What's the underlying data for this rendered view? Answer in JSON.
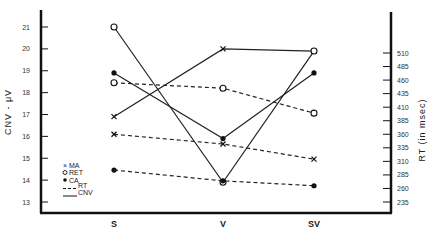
{
  "chart_data": {
    "type": "line",
    "title": "",
    "xlabel": "",
    "ylabel": "CNV - μV",
    "ylabel_right": "RT (in msec)",
    "categories": [
      "S",
      "V",
      "SV"
    ],
    "ylim": [
      13,
      21
    ],
    "ylim_right": [
      235,
      510
    ],
    "yticks": [
      "13",
      "14",
      "15",
      "16",
      "17",
      "18",
      "19",
      "20",
      "21"
    ],
    "yticks_right": [
      "235",
      "260",
      "285",
      "310",
      "335",
      "360",
      "385",
      "410",
      "435",
      "460",
      "485",
      "510"
    ],
    "grid": false,
    "legend_position": "lower-left",
    "legend": [
      {
        "marker": "x",
        "label": "MA"
      },
      {
        "marker": "open-circle",
        "label": "RET"
      },
      {
        "marker": "filled-circle",
        "label": "CA"
      },
      {
        "line": "dashed",
        "label": "RT"
      },
      {
        "line": "solid",
        "label": "CNV"
      }
    ],
    "series": [
      {
        "name": "MA CNV",
        "marker": "x",
        "line": "solid",
        "axis": "left",
        "values": [
          16.9,
          20.0,
          19.9
        ]
      },
      {
        "name": "RET CNV",
        "marker": "open-circle",
        "line": "solid",
        "axis": "left",
        "values": [
          21.0,
          13.9,
          19.9
        ]
      },
      {
        "name": "CA CNV",
        "marker": "filled-circle",
        "line": "solid",
        "axis": "left",
        "values": [
          18.9,
          15.9,
          18.9
        ]
      },
      {
        "name": "MA RT",
        "marker": "x",
        "line": "dashed",
        "axis": "right",
        "values": [
          360,
          342,
          314
        ]
      },
      {
        "name": "RET RT",
        "marker": "open-circle",
        "line": "dashed",
        "axis": "right",
        "values": [
          455,
          445,
          399
        ]
      },
      {
        "name": "CA RT",
        "marker": "filled-circle",
        "line": "dashed",
        "axis": "right",
        "values": [
          294,
          274,
          265
        ]
      }
    ]
  }
}
